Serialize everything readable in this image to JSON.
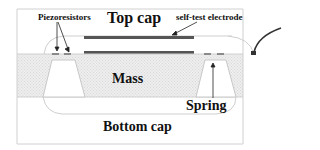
{
  "diagram": {
    "labels": {
      "piezoresistors": "Piezoresistors",
      "top_cap": "Top cap",
      "self_test_electrode": "self-test electrode",
      "mass": "Mass",
      "spring": "Spring",
      "bottom_cap": "Bottom cap"
    },
    "colors": {
      "background": "#ffffff",
      "outline": "#c8c8c8",
      "silicon_fill": "#ececec",
      "electrode": "#555555",
      "text": "#111111",
      "wire": "#333333"
    }
  }
}
